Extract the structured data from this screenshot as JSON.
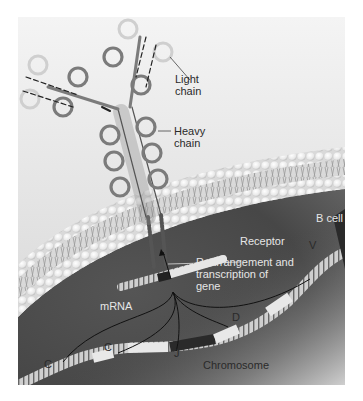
{
  "figure": {
    "colors": {
      "background_top": "#f2f2f2",
      "background_bottom": "#d8d8d8",
      "cytoplasm": "#4a4a4a",
      "membrane": "#efefef",
      "chain": "#7a7a7a",
      "light_chain": "#d6d6d6"
    },
    "labels": {
      "light_chain_line1": "Light",
      "light_chain_line2": "chain",
      "heavy_chain_line1": "Heavy",
      "heavy_chain_line2": "chain",
      "receptor": "Receptor",
      "b_cell": "B cell",
      "rearrangement_line1": "Rearrangement and",
      "rearrangement_line2": "transcription of",
      "rearrangement_line3": "gene",
      "mrna": "mRNA",
      "chromosome": "Chromosome"
    },
    "gene_segments": {
      "v": "V",
      "d": "D",
      "j": "J",
      "c1": "C",
      "c2": "C"
    }
  }
}
